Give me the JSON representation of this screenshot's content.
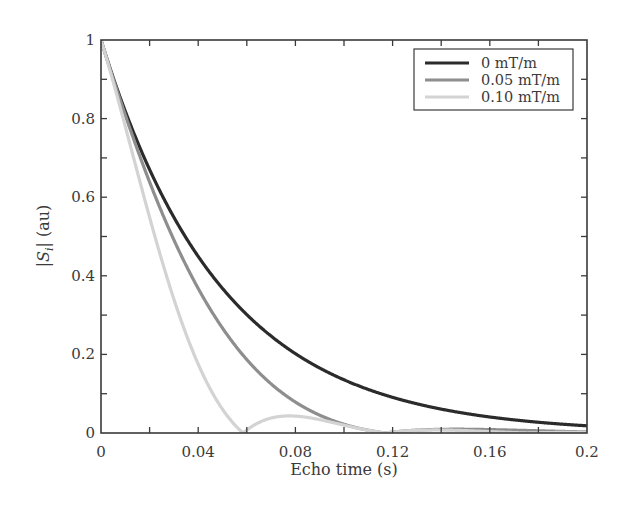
{
  "chart_data": {
    "type": "line",
    "title": "",
    "xlabel": "Echo time (s)",
    "ylabel_main": "|S",
    "ylabel_sub": "i",
    "ylabel_tail": "| (au)",
    "xlim": [
      0,
      0.2
    ],
    "ylim": [
      0,
      1
    ],
    "xticks": [
      0,
      0.04,
      0.08,
      0.12,
      0.16,
      0.2
    ],
    "xtick_labels": [
      "0",
      "0.04",
      "0.08",
      "0.12",
      "0.16",
      "0.2"
    ],
    "yticks": [
      0,
      0.2,
      0.4,
      0.6,
      0.8,
      1
    ],
    "ytick_labels": [
      "0",
      "0.2",
      "0.4",
      "0.6",
      "0.8",
      "1"
    ],
    "grid": false,
    "legend_position": "upper right",
    "x": [
      0,
      0.01,
      0.02,
      0.03,
      0.04,
      0.05,
      0.06,
      0.07,
      0.08,
      0.09,
      0.1,
      0.11,
      0.12,
      0.13,
      0.14,
      0.15,
      0.16,
      0.17,
      0.18,
      0.19,
      0.2
    ],
    "series": [
      {
        "name": "0 mT/m",
        "color": "#2b2b2b",
        "width": 3.2,
        "values": [
          1.0,
          0.819,
          0.67,
          0.549,
          0.449,
          0.368,
          0.301,
          0.247,
          0.202,
          0.165,
          0.135,
          0.111,
          0.091,
          0.074,
          0.061,
          0.05,
          0.041,
          0.033,
          0.027,
          0.022,
          0.018
        ]
      },
      {
        "name": "0.05 mT/m",
        "color": "#8e8e8e",
        "width": 3.2,
        "values": [
          1.0,
          0.809,
          0.639,
          0.492,
          0.368,
          0.269,
          0.188,
          0.127,
          0.081,
          0.047,
          0.024,
          0.007,
          0.002,
          0.007,
          0.009,
          0.009,
          0.009,
          0.007,
          0.005,
          0.004,
          0.003
        ]
      },
      {
        "name": "0.10 mT/m",
        "color": "#d3d3d3",
        "width": 3.2,
        "values": [
          1.0,
          0.781,
          0.549,
          0.343,
          0.18,
          0.066,
          0.008,
          0.038,
          0.042,
          0.034,
          0.02,
          0.007,
          0.002,
          0.006,
          0.007,
          0.005,
          0.003,
          0.001,
          0.002,
          0.002,
          0.001
        ]
      }
    ],
    "model": {
      "decay_constant_s": 0.05,
      "series_zero_crossing_s": [
        null,
        0.117,
        0.0585
      ]
    }
  }
}
